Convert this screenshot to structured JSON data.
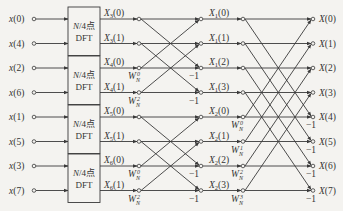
{
  "inputs": [
    "x(0)",
    "x(4)",
    "x(2)",
    "x(6)",
    "x(1)",
    "x(5)",
    "x(3)",
    "x(7)"
  ],
  "dft_blocks": [
    {
      "label_top": "N/4点",
      "label_bottom": "DFT",
      "outputs": [
        "X3(0)",
        "X3(1)"
      ],
      "out_main": [
        "X",
        "X"
      ],
      "out_sub": [
        "3",
        "3"
      ],
      "out_idx": [
        "(0)",
        "(1)"
      ]
    },
    {
      "label_top": "N/4点",
      "label_bottom": "DFT",
      "outputs": [
        "X4(0)",
        "X4(1)"
      ],
      "out_main": [
        "X",
        "X"
      ],
      "out_sub": [
        "4",
        "4"
      ],
      "out_idx": [
        "(0)",
        "(1)"
      ]
    },
    {
      "label_top": "N/4点",
      "label_bottom": "DFT",
      "outputs": [
        "X5(0)",
        "X5(1)"
      ],
      "out_main": [
        "X",
        "X"
      ],
      "out_sub": [
        "5",
        "5"
      ],
      "out_idx": [
        "(0)",
        "(1)"
      ]
    },
    {
      "label_top": "N/4点",
      "label_bottom": "DFT",
      "outputs": [
        "X6(0)",
        "X6(1)"
      ],
      "out_main": [
        "X",
        "X"
      ],
      "out_sub": [
        "6",
        "6"
      ],
      "out_idx": [
        "(0)",
        "(1)"
      ]
    }
  ],
  "stage1_twiddles": [
    "W_N^0",
    "W_N^2",
    "W_N^0",
    "W_N^2"
  ],
  "stage1_outputs": [
    "X1(0)",
    "X1(1)",
    "X1(2)",
    "X1(3)",
    "X2(0)",
    "X2(1)",
    "X2(2)",
    "X2(3)"
  ],
  "stage1_out_sub": [
    "1",
    "1",
    "1",
    "1",
    "2",
    "2",
    "2",
    "2"
  ],
  "stage1_out_idx": [
    "(0)",
    "(1)",
    "(2)",
    "(3)",
    "(0)",
    "(1)",
    "(2)",
    "(3)"
  ],
  "stage2_twiddles": [
    "W_N^0",
    "W_N^1",
    "W_N^2",
    "W_N^3"
  ],
  "outputs": [
    "X(0)",
    "X(1)",
    "X(2)",
    "X(3)",
    "X(4)",
    "X(5)",
    "X(6)",
    "X(7)"
  ],
  "minus_one": "−1",
  "twiddle": {
    "base": "W",
    "sub": "N",
    "exps_stage1": [
      "0",
      "2",
      "0",
      "2"
    ],
    "exps_stage2": [
      "0",
      "1",
      "2",
      "3"
    ]
  },
  "colors": {
    "line": "#3a3a3a",
    "background": "#f4f3f0",
    "text": "#333333"
  }
}
